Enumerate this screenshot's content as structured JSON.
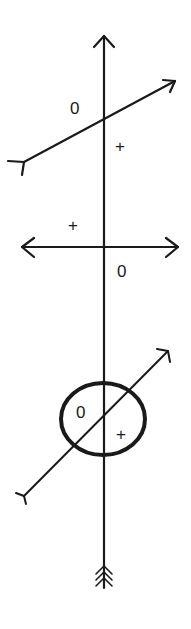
{
  "diagram": {
    "stroke_color": "#1a1a1a",
    "background": "#ffffff",
    "main_axis": {
      "orientation": "vertical",
      "arrow_head": "top",
      "fletching": "bottom"
    },
    "panels": [
      {
        "id": "panel-1",
        "line": "oblique arrow, rising to the right, fletching at left",
        "labels": [
          {
            "text": "0",
            "position": "upper-left"
          },
          {
            "text": "+",
            "position": "lower-right"
          }
        ]
      },
      {
        "id": "panel-2",
        "line": "horizontal double-headed arrow",
        "labels": [
          {
            "text": "+",
            "position": "upper-left"
          },
          {
            "text": "0",
            "position": "lower-right"
          }
        ]
      },
      {
        "id": "panel-3",
        "line": "oblique arrow, rising to the right, fletching at lower-left, passing through oval",
        "shape": "oval",
        "labels": [
          {
            "text": "0",
            "position": "upper-left inside oval"
          },
          {
            "text": "+",
            "position": "lower-right inside oval"
          }
        ]
      }
    ]
  }
}
